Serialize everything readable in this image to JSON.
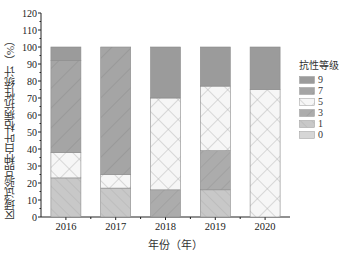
{
  "chart_data": {
    "type": "bar",
    "stacked": true,
    "title": "",
    "xlabel": "年份（年）",
    "ylabel": "区域试验品种白叶枯病抗性统计（%）",
    "ylim": [
      0,
      120
    ],
    "yticks": [
      0,
      10,
      20,
      30,
      40,
      50,
      60,
      70,
      80,
      90,
      100,
      110,
      120
    ],
    "categories": [
      "2016",
      "2017",
      "2018",
      "2019",
      "2020"
    ],
    "legend_title": "抗性等级",
    "legend_position": "right",
    "series": [
      {
        "name": "0",
        "values": [
          0,
          0,
          0,
          0,
          0
        ]
      },
      {
        "name": "1",
        "values": [
          23,
          17,
          0,
          16,
          0
        ]
      },
      {
        "name": "3",
        "values": [
          0,
          0,
          16,
          23,
          0
        ]
      },
      {
        "name": "5",
        "values": [
          15,
          8,
          54,
          38,
          75
        ]
      },
      {
        "name": "7",
        "values": [
          54,
          75,
          0,
          0,
          0
        ]
      },
      {
        "name": "9",
        "values": [
          8,
          0,
          30,
          23,
          25
        ]
      }
    ]
  },
  "legend": {
    "title": "抗性等级",
    "items": [
      {
        "label": "9"
      },
      {
        "label": "7"
      },
      {
        "label": "5"
      },
      {
        "label": "3"
      },
      {
        "label": "1"
      },
      {
        "label": "0"
      }
    ]
  },
  "axes": {
    "xlabel": "年份（年）",
    "ylabel": "区域试验品种白叶枯病抗性统计（%）"
  }
}
